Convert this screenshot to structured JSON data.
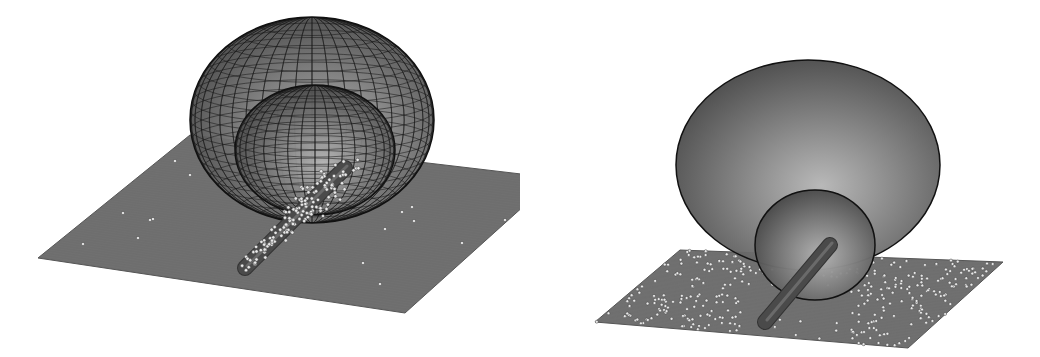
{
  "figure": {
    "colors": {
      "background": "#ffffff",
      "plane": "#6e6e6e",
      "plane_edge": "#555555",
      "mesh_line": "#1a1a1a",
      "dome_fill": "#7a7a7a",
      "dome_highlight": "#b5b5b5",
      "particle": "#e8e8e8",
      "particle_edge": "#444444",
      "tube": "#4a4a4a"
    },
    "panels": [
      {
        "id": "left",
        "plane": [
          [
            38,
            258
          ],
          [
            190,
            135
          ],
          [
            555,
            178
          ],
          [
            405,
            313
          ]
        ],
        "outer_dome": {
          "cx": 312,
          "cy": 120,
          "rx": 122,
          "ry": 103
        },
        "inner_dome": {
          "cx": 315,
          "cy": 150,
          "rx": 80,
          "ry": 65
        },
        "tube": {
          "x1": 245,
          "y1": 268,
          "x2": 345,
          "y2": 168,
          "width": 14
        },
        "particle_cluster": {
          "cx": 300,
          "cy": 210,
          "count": 140
        },
        "scattered_particles": [
          [
            175,
            161
          ],
          [
            190,
            175
          ],
          [
            123,
            213
          ],
          [
            150,
            220
          ],
          [
            153,
            219
          ],
          [
            83,
            244
          ],
          [
            138,
            238
          ],
          [
            323,
            216
          ],
          [
            385,
            229
          ],
          [
            402,
            212
          ],
          [
            412,
            207
          ],
          [
            414,
            221
          ],
          [
            505,
            220
          ],
          [
            363,
            263
          ],
          [
            462,
            243
          ],
          [
            380,
            284
          ],
          [
            555,
            178
          ]
        ]
      },
      {
        "id": "right",
        "plane": [
          [
            595,
            322
          ],
          [
            680,
            250
          ],
          [
            1003,
            262
          ],
          [
            908,
            348
          ]
        ],
        "outer_dome": {
          "cx": 808,
          "cy": 165,
          "rx": 132,
          "ry": 105
        },
        "inner_dome": {
          "cx": 815,
          "cy": 245,
          "rx": 60,
          "ry": 55
        },
        "tube": {
          "x1": 765,
          "y1": 322,
          "x2": 830,
          "y2": 245,
          "width": 14
        },
        "particle_density": "dense",
        "scattered_count_left": 170,
        "scattered_count_right": 170
      }
    ]
  }
}
